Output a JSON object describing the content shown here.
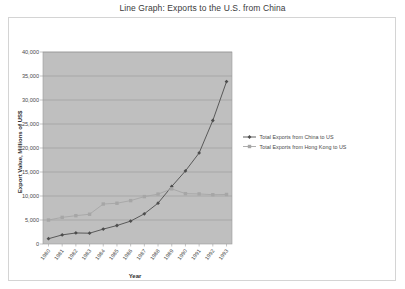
{
  "chart_data": {
    "type": "line",
    "title": "Line Graph: Exports to the U.S. from China",
    "xlabel": "Year",
    "ylabel": "Export Value, Millions of US$",
    "categories": [
      "1980",
      "1981",
      "1982",
      "1983",
      "1984",
      "1985",
      "1986",
      "1987",
      "1988",
      "1989",
      "1990",
      "1991",
      "1992",
      "1993"
    ],
    "ylim": [
      0,
      40000
    ],
    "ytick_labels": [
      "0",
      "5,000",
      "10,000",
      "15,000",
      "20,000",
      "25,000",
      "30,000",
      "35,000",
      "40,000"
    ],
    "ytick_values": [
      0,
      5000,
      10000,
      15000,
      20000,
      25000,
      30000,
      35000,
      40000
    ],
    "grid": true,
    "legend_position": "right",
    "series": [
      {
        "name": "Total Exports from China to US",
        "color": "#4d4d4d",
        "marker": "diamond",
        "values": [
          1100,
          1900,
          2300,
          2250,
          3100,
          3850,
          4770,
          6290,
          8510,
          11990,
          15220,
          18970,
          25730,
          33830
        ]
      },
      {
        "name": "Total Exports from Hong Kong to US",
        "color": "#a6a6a6",
        "marker": "square",
        "values": [
          4990,
          5550,
          5900,
          6200,
          8330,
          8490,
          9040,
          9870,
          10400,
          11490,
          10490,
          10430,
          10270,
          10320
        ]
      }
    ]
  },
  "legend": {
    "items": [
      {
        "label": "Total Exports from China to US"
      },
      {
        "label": "Total Exports from Hong Kong to US"
      }
    ]
  },
  "colors": {
    "plot_background": "#bfbfbf",
    "chart_background": "#ffffff",
    "gridline": "#8f8f8f",
    "border": "#d4d4d4",
    "series_china": "#4d4d4d",
    "series_hongkong": "#a6a6a6",
    "text": "#4a4a4a"
  }
}
